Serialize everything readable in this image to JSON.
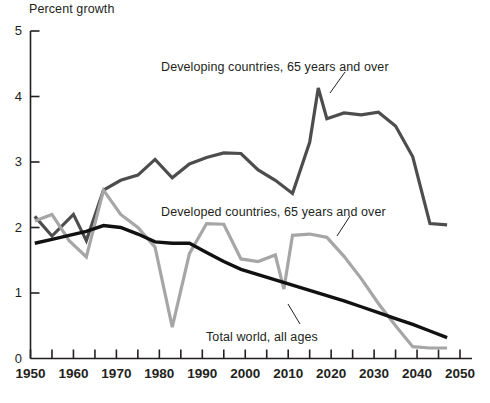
{
  "chart_data": {
    "type": "line",
    "title": "",
    "ylabel": "Percent growth",
    "xlabel": "",
    "xlim": [
      1950,
      2050
    ],
    "ylim": [
      0,
      5
    ],
    "ytick_labels": [
      "0",
      "1",
      "2",
      "3",
      "4",
      "5"
    ],
    "ytick_values": [
      0,
      1,
      2,
      3,
      4,
      5
    ],
    "xtick_labels": [
      "1950",
      "1960",
      "1970",
      "1980",
      "1990",
      "2000",
      "2010",
      "2020",
      "2030",
      "2040",
      "2050"
    ],
    "xtick_values": [
      1950,
      1960,
      1970,
      1980,
      1990,
      2000,
      2010,
      2020,
      2030,
      2040,
      2050
    ],
    "xminor_step": 5,
    "grid": false,
    "legend_position": "inline-annotations",
    "series": [
      {
        "name": "Developing countries, 65 years and over",
        "color": "#4d4d4d",
        "linewidth": 3.2,
        "x": [
          1951,
          1955,
          1960,
          1963,
          1967,
          1971,
          1975,
          1979,
          1983,
          1987,
          1991,
          1995,
          1999,
          2003,
          2007,
          2011,
          2015,
          2017,
          2019,
          2023,
          2027,
          2031,
          2035,
          2039,
          2043,
          2047
        ],
        "values": [
          2.17,
          1.87,
          2.2,
          1.8,
          2.57,
          2.72,
          2.8,
          3.04,
          2.76,
          2.97,
          3.07,
          3.14,
          3.13,
          2.88,
          2.72,
          2.52,
          3.3,
          4.13,
          3.66,
          3.75,
          3.72,
          3.76,
          3.55,
          3.08,
          2.06,
          2.04
        ]
      },
      {
        "name": "Developed countries, 65 years and over",
        "color": "#a6a6a6",
        "linewidth": 3.2,
        "x": [
          1951,
          1955,
          1959,
          1963,
          1967,
          1971,
          1975,
          1979,
          1983,
          1987,
          1991,
          1995,
          1999,
          2003,
          2007,
          2009,
          2011,
          2015,
          2019,
          2023,
          2027,
          2031,
          2035,
          2039,
          2043,
          2047
        ],
        "values": [
          2.1,
          2.2,
          1.8,
          1.55,
          2.57,
          2.2,
          2.0,
          1.7,
          0.48,
          1.6,
          2.06,
          2.05,
          1.52,
          1.48,
          1.58,
          1.06,
          1.88,
          1.9,
          1.85,
          1.56,
          1.22,
          0.84,
          0.5,
          0.18,
          0.16,
          0.16
        ]
      },
      {
        "name": "Total world, all ages",
        "color": "#111111",
        "linewidth": 3.4,
        "x": [
          1951,
          1955,
          1959,
          1963,
          1967,
          1971,
          1975,
          1979,
          1983,
          1987,
          1991,
          1995,
          1999,
          2003,
          2007,
          2011,
          2015,
          2019,
          2023,
          2027,
          2031,
          2035,
          2039,
          2043,
          2047
        ],
        "values": [
          1.76,
          1.82,
          1.88,
          1.94,
          2.03,
          2.0,
          1.9,
          1.78,
          1.76,
          1.76,
          1.62,
          1.48,
          1.36,
          1.28,
          1.2,
          1.12,
          1.04,
          0.96,
          0.88,
          0.79,
          0.7,
          0.61,
          0.52,
          0.42,
          0.32
        ]
      }
    ],
    "annotations": [
      {
        "text": "Developing countries, 65 years and over",
        "x_px": 161,
        "y_px": 60
      },
      {
        "text": "Developed countries, 65 years and over",
        "x_px": 161,
        "y_px": 205
      },
      {
        "text": "Total world, all ages",
        "x_px": 206,
        "y_px": 330
      }
    ]
  },
  "axis": {
    "ylabel": "Percent growth",
    "y_labels": [
      "5",
      "4",
      "3",
      "2",
      "1",
      "0"
    ],
    "x_labels": [
      "1950",
      "1960",
      "1970",
      "1980",
      "1990",
      "2000",
      "2010",
      "2020",
      "2030",
      "2040",
      "2050"
    ]
  },
  "colors": {
    "developing": "#4d4d4d",
    "developed": "#a6a6a6",
    "total_world": "#111111",
    "axis": "#231f20",
    "background": "#ffffff"
  }
}
